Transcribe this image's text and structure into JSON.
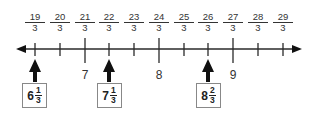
{
  "number_line": {
    "tick_labels": [
      {
        "numerator": "19",
        "denominator": "3",
        "x": 35
      },
      {
        "numerator": "20",
        "denominator": "3",
        "x": 60
      },
      {
        "numerator": "21",
        "denominator": "3",
        "x": 85
      },
      {
        "numerator": "22",
        "denominator": "3",
        "x": 109
      },
      {
        "numerator": "23",
        "denominator": "3",
        "x": 134
      },
      {
        "numerator": "24",
        "denominator": "3",
        "x": 159
      },
      {
        "numerator": "25",
        "denominator": "3",
        "x": 184
      },
      {
        "numerator": "26",
        "denominator": "3",
        "x": 208
      },
      {
        "numerator": "27",
        "denominator": "3",
        "x": 233
      },
      {
        "numerator": "28",
        "denominator": "3",
        "x": 258
      },
      {
        "numerator": "29",
        "denominator": "3",
        "x": 283
      }
    ],
    "whole_numbers": [
      {
        "label": "7",
        "x": 85
      },
      {
        "label": "8",
        "x": 159
      },
      {
        "label": "9",
        "x": 233
      }
    ],
    "markers": [
      {
        "whole": "6",
        "numerator": "1",
        "denominator": "3",
        "x": 35
      },
      {
        "whole": "7",
        "numerator": "1",
        "denominator": "3",
        "x": 109
      },
      {
        "whole": "8",
        "numerator": "2",
        "denominator": "3",
        "x": 208
      }
    ],
    "colors": {
      "line": "#2a2a2a",
      "arrow": "#111111",
      "box_border": "#888888"
    }
  }
}
